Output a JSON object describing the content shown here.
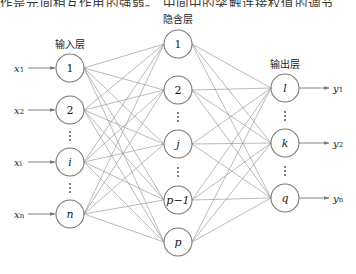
{
  "top_text": "作是元间相互作用的强弱。  中间中的突触连接权值的调节",
  "caption": "",
  "layers": {
    "input": {
      "title": "输入层",
      "nodes": [
        {
          "label": "1",
          "italic": false,
          "x": 70,
          "y": 68,
          "input": "x",
          "sub": "1"
        },
        {
          "label": "2",
          "italic": false,
          "x": 70,
          "y": 110,
          "input": "x",
          "sub": "2"
        },
        {
          "label": "i",
          "italic": true,
          "x": 70,
          "y": 162,
          "input": "x",
          "sub": "i"
        },
        {
          "label": "n",
          "italic": true,
          "x": 70,
          "y": 214,
          "input": "x",
          "sub": "n"
        }
      ],
      "ellipsis": [
        136,
        188
      ]
    },
    "hidden": {
      "title": "隐含层",
      "nodes": [
        {
          "label": "1",
          "italic": false,
          "x": 178,
          "y": 44
        },
        {
          "label": "2",
          "italic": false,
          "x": 178,
          "y": 90
        },
        {
          "label": "j",
          "italic": true,
          "x": 178,
          "y": 144
        },
        {
          "label": "p−1",
          "italic": true,
          "x": 178,
          "y": 200
        },
        {
          "label": "p",
          "italic": true,
          "x": 178,
          "y": 242
        }
      ],
      "ellipsis": [
        117,
        172
      ]
    },
    "output": {
      "title": "输出层",
      "nodes": [
        {
          "label": "l",
          "italic": true,
          "x": 285,
          "y": 88,
          "output": "y",
          "sub": "1"
        },
        {
          "label": "k",
          "italic": true,
          "x": 285,
          "y": 143,
          "output": "y",
          "sub": "2"
        },
        {
          "label": "q",
          "italic": true,
          "x": 285,
          "y": 198,
          "output": "y",
          "sub": "n"
        }
      ],
      "ellipsis": [
        116,
        171
      ]
    }
  },
  "node_radius": 14,
  "colors": {
    "edge": "#8c8c8c",
    "node_stroke": "#7a7a7a",
    "text": "#1a1a1a"
  }
}
